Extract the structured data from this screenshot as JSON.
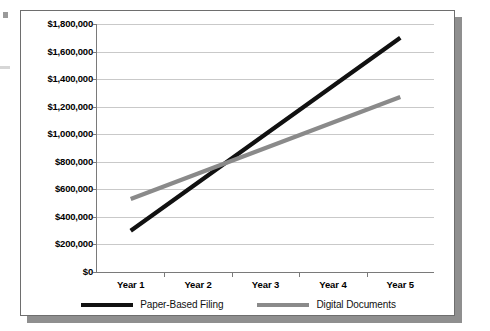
{
  "chart_data": {
    "type": "line",
    "title": "",
    "xlabel": "",
    "ylabel": "",
    "categories": [
      "Year 1",
      "Year 2",
      "Year 3",
      "Year 4",
      "Year 5"
    ],
    "series": [
      {
        "name": "Paper-Based Filing",
        "color": "#111111",
        "values": [
          300000,
          650000,
          1000000,
          1350000,
          1700000
        ]
      },
      {
        "name": "Digital Documents",
        "color": "#8a8a8a",
        "values": [
          530000,
          715000,
          900000,
          1085000,
          1270000
        ]
      }
    ],
    "ylim": [
      0,
      1800000
    ],
    "ytick_step": 200000,
    "ytick_labels": [
      "$1,800,000",
      "$1,600,000",
      "$1,400,000",
      "$1,200,000",
      "$1,000,000",
      "$800,000",
      "$600,000",
      "$400,000",
      "$200,000",
      "$0"
    ],
    "ytick_values": [
      1800000,
      1600000,
      1400000,
      1200000,
      1000000,
      800000,
      600000,
      400000,
      200000,
      0
    ],
    "grid": true,
    "legend_position": "bottom",
    "annotations": []
  },
  "legend": {
    "items": [
      {
        "label": "Paper-Based Filing",
        "color": "#111111"
      },
      {
        "label": "Digital Documents",
        "color": "#8a8a8a"
      }
    ]
  },
  "style": {
    "card_background": "#ffffff",
    "card_border": "#6e6e6e",
    "shadow_color": "#8f8f8f",
    "gridline_color": "#c9c9c9",
    "axis_color": "#7a7a7a"
  }
}
